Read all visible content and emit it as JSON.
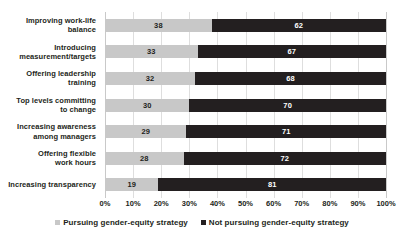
{
  "chart_data": {
    "type": "bar",
    "orientation": "horizontal",
    "stacked": true,
    "stacked_percent": true,
    "title": "",
    "subtitle": "",
    "xlabel": "",
    "ylabel": "",
    "xlim": [
      0,
      100
    ],
    "grid": true,
    "grid_axis": "x",
    "legend_position": "bottom",
    "xticks": [
      "0%",
      "10%",
      "20%",
      "30%",
      "40%",
      "50%",
      "60%",
      "70%",
      "80%",
      "90%",
      "100%"
    ],
    "xtick_values": [
      0,
      10,
      20,
      30,
      40,
      50,
      60,
      70,
      80,
      90,
      100
    ],
    "categories": [
      "Improving work-life balance",
      "Introducing measurement/targets",
      "Offering leadership training",
      "Top levels committing to change",
      "Increasing awareness among managers",
      "Offering flexible work hours",
      "Increasing transparency"
    ],
    "category_lines": [
      [
        "Improving work-life",
        "balance"
      ],
      [
        "Introducing",
        "measurement/targets"
      ],
      [
        "Offering leadership",
        "training"
      ],
      [
        "Top levels committing",
        "to change"
      ],
      [
        "Increasing awareness",
        "among managers"
      ],
      [
        "Offering flexible",
        "work hours"
      ],
      [
        "Increasing transparency"
      ]
    ],
    "series": [
      {
        "name": "Pursuing gender-equity strategy",
        "color": "#c8c8c8",
        "values": [
          38,
          33,
          32,
          30,
          29,
          28,
          19
        ]
      },
      {
        "name": "Not pursuing gender-equity strategy",
        "color": "#231f20",
        "values": [
          62,
          67,
          68,
          70,
          71,
          72,
          81
        ]
      }
    ]
  },
  "legend": {
    "items": [
      {
        "label": "Pursuing gender-equity strategy",
        "color": "#c8c8c8"
      },
      {
        "label": "Not pursuing gender-equity strategy",
        "color": "#231f20"
      }
    ]
  },
  "colors": {
    "series_a": "#c8c8c8",
    "series_b": "#231f20",
    "gridline": "#dedede",
    "background": "#ffffff"
  }
}
